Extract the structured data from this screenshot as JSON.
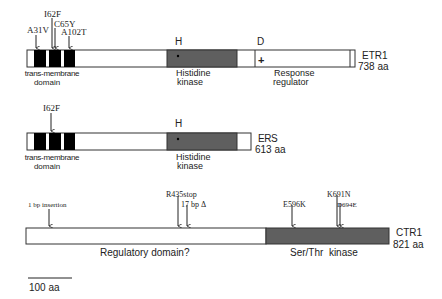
{
  "colors": {
    "kinase_fill": "#5f5f5f",
    "tm_fill": "#000000",
    "outline": "#333333",
    "text": "#222222"
  },
  "proteins": [
    {
      "id": "etr1",
      "name": "ETR1",
      "length": "738 aa",
      "domains": {
        "tm_label_line1": "trans-membrane",
        "tm_label_line2": "domain",
        "kinase_label_line1": "Histidine",
        "kinase_label_line2": "kinase",
        "kinase_marker": "H",
        "receiver_marker": "D",
        "receiver_symbol": "+",
        "receiver_label_line1": "Response",
        "receiver_label_line2": "regulator"
      },
      "mutations": [
        "A31V",
        "I62F",
        "C65Y",
        "A102T"
      ]
    },
    {
      "id": "ers",
      "name": "ERS",
      "length": "613 aa",
      "domains": {
        "tm_label_line1": "trans-membrane",
        "tm_label_line2": "domain",
        "kinase_label_line1": "Histidine",
        "kinase_label_line2": "kinase",
        "kinase_marker": "H"
      },
      "mutations": [
        "I62F"
      ]
    },
    {
      "id": "ctr1",
      "name": "CTR1",
      "length": "821 aa",
      "domains": {
        "regulatory_label": "Regulatory domain?",
        "kinase_label": "Ser/Thr  kinase"
      },
      "mutations": [
        "1 bp insertion",
        "R435stop",
        "17 bp Δ",
        "E596K",
        "K691N",
        "D694E"
      ]
    }
  ],
  "scale_bar": {
    "label": "100 aa"
  }
}
